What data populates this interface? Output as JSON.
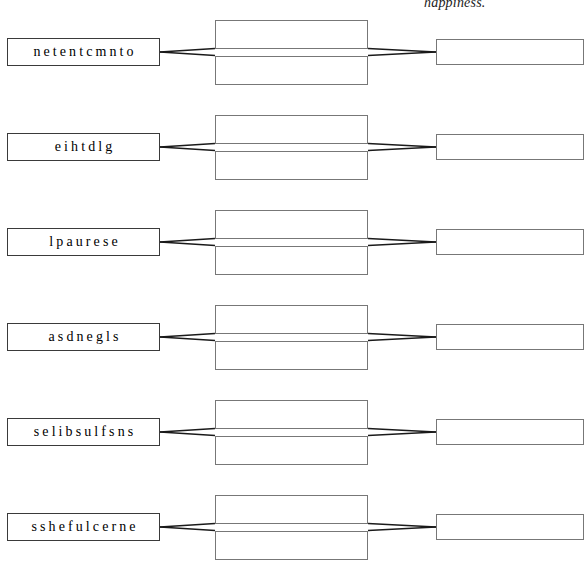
{
  "page": {
    "width": 588,
    "height": 581,
    "background_color": "#ffffff",
    "caption_clipped": "happiness."
  },
  "style": {
    "box_border_color": "#6e6e6e",
    "scramble_border_color": "#3a3a3a",
    "line_color": "#1a1a1a",
    "text_color": "#000000"
  },
  "layout": {
    "left_box": {
      "x": 7,
      "width": 153,
      "height": 28
    },
    "middle_box": {
      "x": 215,
      "width": 153,
      "height": 29
    },
    "right_box": {
      "x": 436,
      "width": 148,
      "height": 26
    },
    "row_pitch": 95,
    "first_row_center_y": 52
  },
  "rows": [
    {
      "scramble": "netentcmnto",
      "middle_top_answer": "",
      "middle_bottom_answer": "",
      "right_answer": ""
    },
    {
      "scramble": "eihtdlg",
      "middle_top_answer": "",
      "middle_bottom_answer": "",
      "right_answer": ""
    },
    {
      "scramble": "lpaurese",
      "middle_top_answer": "",
      "middle_bottom_answer": "",
      "right_answer": ""
    },
    {
      "scramble": "asdnegls",
      "middle_top_answer": "",
      "middle_bottom_answer": "",
      "right_answer": ""
    },
    {
      "scramble": "selibsulfsns",
      "middle_top_answer": "",
      "middle_bottom_answer": "",
      "right_answer": ""
    },
    {
      "scramble": "sshefulcerne",
      "middle_top_answer": "",
      "middle_bottom_answer": "",
      "right_answer": ""
    }
  ]
}
